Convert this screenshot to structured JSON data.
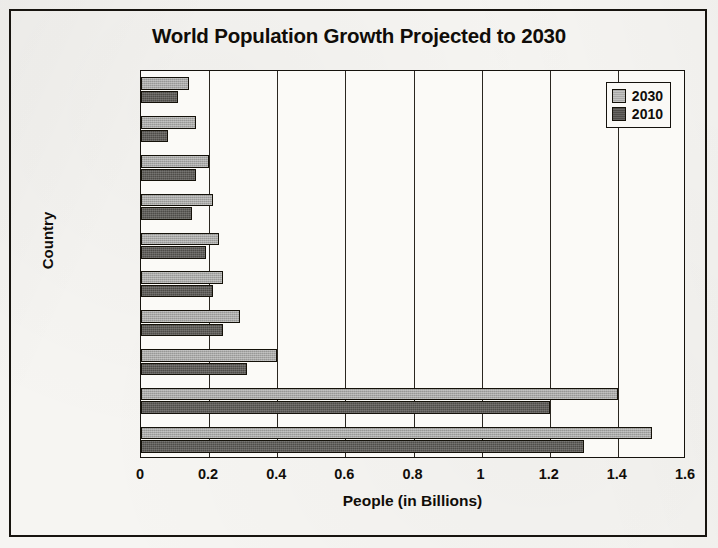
{
  "page": {
    "background_color": "#f6f5f2",
    "border_color": "#17140f"
  },
  "chart_data": {
    "type": "bar",
    "orientation": "horizontal",
    "title": "World Population Growth Projected to 2030",
    "xlabel": "People (in Billions)",
    "ylabel": "Country",
    "categories": [
      "Philiipines",
      "Ethiopia",
      "Bangladesh",
      "Nigeria",
      "Pakistan",
      "Brazil",
      "Indonesia",
      "USA",
      "China",
      "India"
    ],
    "series": [
      {
        "name": "2030",
        "color": "#a9a9a7",
        "values": [
          0.14,
          0.16,
          0.2,
          0.21,
          0.23,
          0.24,
          0.29,
          0.4,
          1.4,
          1.5
        ]
      },
      {
        "name": "2010",
        "color": "#4e4c48",
        "values": [
          0.11,
          0.08,
          0.16,
          0.15,
          0.19,
          0.21,
          0.24,
          0.31,
          1.2,
          1.3
        ]
      }
    ],
    "xlim": [
      0,
      1.6
    ],
    "xticks": [
      0,
      0.2,
      0.4,
      0.6,
      0.8,
      1,
      1.2,
      1.4,
      1.6
    ],
    "xtick_labels": [
      "0",
      "0.2",
      "0.4",
      "0.6",
      "0.8",
      "1",
      "1.2",
      "1.4",
      "1.6"
    ],
    "grid": "vertical",
    "legend_position": "top-right-inside",
    "legend_entries": [
      "2030",
      "2010"
    ]
  }
}
